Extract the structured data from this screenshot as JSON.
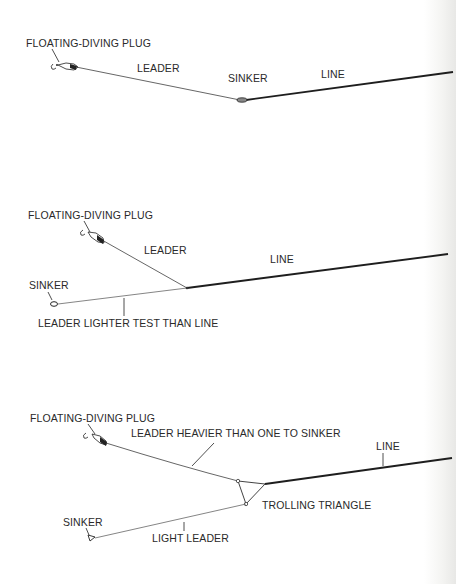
{
  "figures": [
    {
      "id": "rig-1",
      "labels": {
        "plug": "FLOATING-DIVING PLUG",
        "leader": "LEADER",
        "sinker": "SINKER",
        "line": "LINE"
      }
    },
    {
      "id": "rig-2",
      "labels": {
        "plug": "FLOATING-DIVING PLUG",
        "leader": "LEADER",
        "line": "LINE",
        "sinker": "SINKER",
        "sinker_leader": "LEADER LIGHTER TEST THAN LINE"
      }
    },
    {
      "id": "rig-3",
      "labels": {
        "plug": "FLOATING-DIVING PLUG",
        "leader": "LEADER HEAVIER THAN ONE TO SINKER",
        "line": "LINE",
        "triangle": "TROLLING TRIANGLE",
        "sinker": "SINKER",
        "sinker_leader": "LIGHT LEADER"
      }
    }
  ],
  "colors": {
    "ink": "#2a2a2a",
    "line": "#1e1e1e",
    "leader": "#555555",
    "paper": "#ffffff"
  }
}
